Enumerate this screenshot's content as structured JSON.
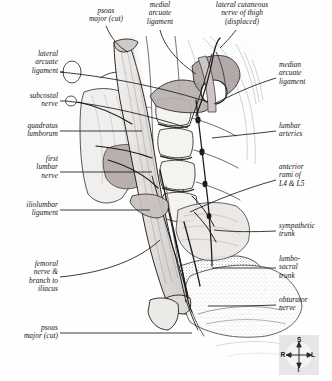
{
  "figure": {
    "kind": "anatomical-illustration",
    "view": "anterior view of posterior abdominal wall"
  },
  "labels_top": [
    {
      "id": "psoas-major-cut-top",
      "text": "psoas\nmajor (cut)"
    },
    {
      "id": "medial-arcuate-ligament",
      "text": "medial\narcuate\nligament"
    },
    {
      "id": "lateral-cutaneous-nerve-of-thigh",
      "text": "lateral cutaneous\nnerve of thigh\n(displaced)"
    }
  ],
  "labels_left": [
    {
      "id": "lateral-arcuate-ligament",
      "text": "lateral\narcuate\nligament"
    },
    {
      "id": "subcostal-nerve",
      "text": "subcostal\nnerve"
    },
    {
      "id": "quadratus-lumborum",
      "text": "quadratus\nlumborum"
    },
    {
      "id": "first-lumbar-nerve",
      "text": "first\nlumbar\nnerve"
    },
    {
      "id": "iliolumbar-ligament",
      "text": "iliolumbar\nligament"
    },
    {
      "id": "femoral-nerve-and-branch-to-iliacus",
      "text": "femoral\nnerve &\nbranch to\niliacus"
    },
    {
      "id": "psoas-major-cut-bottom",
      "text": "psoas\nmajor (cut)"
    }
  ],
  "labels_right": [
    {
      "id": "median-arcuate-ligament",
      "text": "median\narcuate\nligament"
    },
    {
      "id": "lumbar-arteries",
      "text": "lumbar\narteries"
    },
    {
      "id": "anterior-rami-l4-l5",
      "text": "anterior\nrami of\nL4 & L5"
    },
    {
      "id": "sympathetic-trunk",
      "text": "sympathetic\ntrunk"
    },
    {
      "id": "lumbosacral-trunk",
      "text": "lumbo-\nsacral\ntrunk"
    },
    {
      "id": "obturator-nerve",
      "text": "obturator\nnerve"
    }
  ],
  "compass": {
    "superior": "S",
    "inferior": "I",
    "right": "R",
    "left": "L"
  },
  "colors": {
    "ink": "#141414",
    "paper": "#fefefe",
    "muscle_tint": "#b9b0ae",
    "bone_tint": "#dedbd6",
    "leader": "#1a1a1a",
    "compass_bg": "#e6e6e6"
  }
}
